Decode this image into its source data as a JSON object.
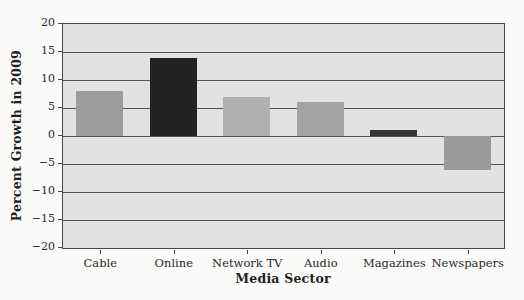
{
  "figure": {
    "background": "#fafaf9",
    "plot_background": "#e2e2e2",
    "border_color": "#474747",
    "grid_color": "#545454",
    "text_color": "#2a2a2a"
  },
  "chart_data": {
    "type": "bar",
    "title": "",
    "xlabel": "Media Sector",
    "ylabel": "Percent Growth in 2009",
    "categories": [
      "Cable",
      "Online",
      "Network TV",
      "Audio",
      "Magazines",
      "Newspapers"
    ],
    "values": [
      8,
      14,
      7,
      6,
      1,
      -6
    ],
    "bar_colors": [
      "#9c9c9c",
      "#232323",
      "#b0b0b0",
      "#a3a3a3",
      "#343434",
      "#9a9a9a"
    ],
    "ylim": [
      -20,
      20
    ],
    "ytick_step": 5,
    "yticks": [
      20,
      15,
      10,
      5,
      0,
      -5,
      -10,
      -15,
      -20
    ],
    "ytick_labels": [
      "20",
      "15",
      "10",
      "5",
      "0",
      "−5",
      "−10",
      "−15",
      "−20"
    ],
    "grid": true,
    "legend_position": "none",
    "bar_width_px": 47
  }
}
